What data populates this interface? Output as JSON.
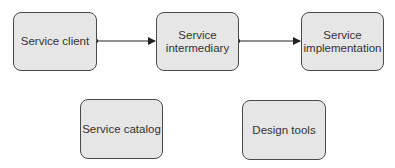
{
  "diagram": {
    "nodes": [
      {
        "id": "client",
        "label": "Service client"
      },
      {
        "id": "intermediary",
        "label": "Service intermediary",
        "line1": "Service",
        "line2": "intermediary"
      },
      {
        "id": "implementation",
        "label": "Service implementation",
        "line1": "Service",
        "line2": "implementation"
      },
      {
        "id": "catalog",
        "label": "Service catalog"
      },
      {
        "id": "tools",
        "label": "Design tools"
      }
    ],
    "edges": [
      {
        "from": "client",
        "to": "intermediary",
        "style": "dot-to-arrow"
      },
      {
        "from": "intermediary",
        "to": "implementation",
        "style": "dot-to-arrow"
      }
    ],
    "colors": {
      "box_fill": "#e6e6e6",
      "box_border": "#4a4a4a",
      "line": "#222222",
      "text": "#333333"
    }
  }
}
